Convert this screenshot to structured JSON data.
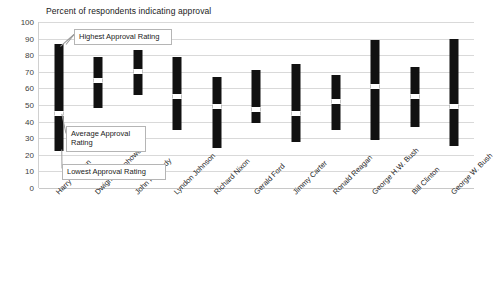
{
  "chart_data": {
    "type": "bar",
    "title": "Percent of respondents indicating approval",
    "xlabel": "",
    "ylabel": "",
    "ylim": [
      0,
      100
    ],
    "y_ticks": [
      0,
      10,
      20,
      30,
      40,
      50,
      60,
      70,
      80,
      90,
      100
    ],
    "grid": true,
    "legend": "none",
    "categories": [
      "Harry Truman",
      "Dwight Eisenhower",
      "John Kennedy",
      "Lyndon Johnson",
      "Richard Nixon",
      "Gerald Ford",
      "Jimmy Carter",
      "Ronald Reagan",
      "George H.W. Bush",
      "Bill Clinton",
      "George W. Bush"
    ],
    "series": [
      {
        "name": "Lowest Approval Rating",
        "values": [
          22,
          48,
          56,
          35,
          24,
          39,
          28,
          35,
          29,
          37,
          25
        ]
      },
      {
        "name": "Average Approval Rating",
        "values": [
          45,
          65,
          70,
          55,
          49,
          47,
          45,
          52,
          61,
          55,
          49
        ]
      },
      {
        "name": "Highest Approval Rating",
        "values": [
          87,
          79,
          83,
          79,
          67,
          71,
          75,
          68,
          89,
          73,
          90
        ]
      }
    ],
    "annotations": [
      {
        "id": "highest",
        "text": "Highest Approval Rating",
        "points_to": "Harry Truman high"
      },
      {
        "id": "average",
        "text": "Average Approval Rating",
        "points_to": "Harry Truman average"
      },
      {
        "id": "lowest",
        "text": "Lowest Approval Rating",
        "points_to": "Harry Truman low"
      }
    ],
    "colors": {
      "bar": "#111111",
      "average_marker": "#ffffff",
      "grid": "#d9d9d9",
      "background": "#ffffff"
    }
  }
}
